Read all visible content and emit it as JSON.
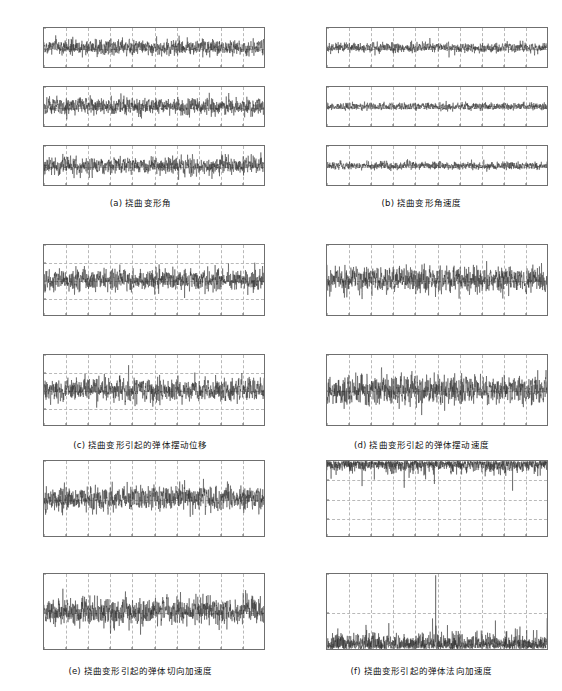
{
  "figure": {
    "background": "#ffffff",
    "trace_color": "#2b2b2b",
    "grid_color": "#b9b9b9",
    "axis_color": "#6f6f6f",
    "xlabel": "t / s",
    "xticks": [
      "0",
      "10",
      "20",
      "30",
      "40",
      "50",
      "60",
      "70",
      "80",
      "90",
      "100"
    ],
    "xlim": [
      0,
      100
    ]
  },
  "panels": [
    {
      "id": "a",
      "caption": "(a) 挠曲变形角",
      "subplots": [
        {
          "ylabel_html": "&Delta;<sub>ϕy</sub> / (°)",
          "ylabel_text": "Δϕy / (°)",
          "yticks": [
            "1",
            "0",
            "-1"
          ],
          "ylim": [
            -1,
            1
          ],
          "gridlines_y": [
            -1,
            0,
            1
          ],
          "noise_sigma": 0.27,
          "seed": 11
        },
        {
          "ylabel_html": "&Delta;<sub>ϕy</sub> / (°)",
          "ylabel_text": "Δϕy / (°)",
          "yticks": [
            "1",
            "0",
            "-1"
          ],
          "ylim": [
            -1,
            1
          ],
          "gridlines_y": [
            -1,
            0,
            1
          ],
          "noise_sigma": 0.3,
          "seed": 23
        },
        {
          "ylabel_html": "&Delta;<sub>ϕz</sub> / (°)",
          "ylabel_text": "Δϕz / (°)",
          "yticks": [
            "1",
            "0",
            "-1"
          ],
          "ylim": [
            -1,
            1
          ],
          "gridlines_y": [
            -1,
            0,
            1
          ],
          "noise_sigma": 0.3,
          "seed": 37
        }
      ]
    },
    {
      "id": "b",
      "caption": "(b) 挠曲变形角速度",
      "subplots": [
        {
          "ylabel_html": "&omega;<sub>ϕx</sub> / (°) ·/s",
          "ylabel_text": "ωϕx / (°)/s",
          "yticks": [
            "20",
            "0",
            "-20"
          ],
          "ylim": [
            -20,
            20
          ],
          "gridlines_y": [
            -20,
            0,
            20
          ],
          "noise_sigma": 3.4,
          "seed": 51
        },
        {
          "ylabel_html": "&omega;<sub>ϕy</sub> / (°) ·/s",
          "ylabel_text": "ωϕy / (°)/s",
          "yticks": [
            "50",
            "0",
            "-50"
          ],
          "ylim": [
            -50,
            50
          ],
          "gridlines_y": [
            -50,
            0,
            50
          ],
          "noise_sigma": 6.5,
          "seed": 67
        },
        {
          "ylabel_html": "&omega;<sub>ϕz</sub> / (°) ·/s",
          "ylabel_text": "ωϕz / (°)/s",
          "yticks": [
            "50",
            "0",
            "-50"
          ],
          "ylim": [
            -50,
            50
          ],
          "gridlines_y": [
            -50,
            0,
            50
          ],
          "noise_sigma": 6.8,
          "seed": 83
        }
      ]
    },
    {
      "id": "c",
      "caption": "(c) 挠曲变形引起的弹体摆动位移",
      "subplots": [
        {
          "ylabel_html": "<span class=\"it\">P</span><sub>fy</sub> / m",
          "ylabel_text": "Pfy / m",
          "yticks": [
            "0.02",
            "0.01",
            "0",
            "-0.01",
            "-0.02"
          ],
          "ylim": [
            -0.02,
            0.02
          ],
          "gridlines_y": [
            -0.02,
            -0.01,
            0,
            0.01,
            0.02
          ],
          "noise_sigma": 0.0042,
          "seed": 101
        },
        {
          "ylabel_html": "<span class=\"it\">P</span><sub>fz</sub> / m",
          "ylabel_text": "Pfz / m",
          "yticks": [
            "0.02",
            "0.01",
            "0",
            "-0.01",
            "-0.02"
          ],
          "ylim": [
            -0.02,
            0.02
          ],
          "gridlines_y": [
            -0.02,
            -0.01,
            0,
            0.01,
            0.02
          ],
          "noise_sigma": 0.0045,
          "seed": 113
        }
      ]
    },
    {
      "id": "d",
      "caption": "(d) 挠曲变形引起的弹体摆动速度",
      "subplots": [
        {
          "ylabel_html": "<span class=\"it\">V</span><sub>fy</sub> / m/s",
          "ylabel_text": "Vfy / m/s",
          "yticks": [
            "0.5",
            "0",
            "-0.5"
          ],
          "ylim": [
            -0.5,
            0.5
          ],
          "gridlines_y": [
            -0.5,
            0,
            0.5
          ],
          "noise_sigma": 0.13,
          "seed": 131
        },
        {
          "ylabel_html": "<span class=\"it\">V</span><sub>fz</sub> / m/s",
          "ylabel_text": "Vfz / m/s",
          "yticks": [
            "0.5",
            "0",
            "-0.5"
          ],
          "ylim": [
            -0.5,
            0.5
          ],
          "gridlines_y": [
            -0.5,
            0,
            0.5
          ],
          "noise_sigma": 0.14,
          "seed": 149
        }
      ]
    },
    {
      "id": "e",
      "caption": "(e) 挠曲变形引起的弹体切向加速度",
      "subplots": [
        {
          "ylabel_html": "<span class=\"it\">a</span><sub>fy</sub> / m·s<sup>-2</sup>",
          "ylabel_text": "afy / m·s-2",
          "yticks": [
            "5",
            "0",
            "-5"
          ],
          "ylim": [
            -5,
            5
          ],
          "gridlines_y": [
            -5,
            0,
            5
          ],
          "noise_sigma": 1.1,
          "seed": 167
        },
        {
          "ylabel_html": "<span class=\"it\">a</span><sub>fz</sub> / m·s<sup>-2</sup>",
          "ylabel_text": "afz / m·s-2",
          "yticks": [
            "5",
            "0",
            "-5"
          ],
          "ylim": [
            -5,
            5
          ],
          "gridlines_y": [
            -5,
            0,
            5
          ],
          "noise_sigma": 1.3,
          "seed": 181
        }
      ]
    },
    {
      "id": "f",
      "caption": "(f) 挠曲变形引起的弹体法向加速度",
      "subplots": [
        {
          "ylabel_html": "<span class=\"it\">a</span><sub>fny</sub> / m·s<sup>-2</sup>",
          "ylabel_text": "afny / m·s-2",
          "yticks": [
            "0",
            "-0.1",
            "-0.2",
            "-0.3",
            "-0.4"
          ],
          "ylim": [
            -0.4,
            0
          ],
          "gridlines_y": [
            -0.4,
            -0.3,
            -0.2,
            -0.1,
            0
          ],
          "noise_sigma": 0.03,
          "rectified": "negative",
          "seed": 199
        },
        {
          "ylabel_html": "<span class=\"it\">a</span><sub>fnz</sub> / m·s<sup>-2</sup>",
          "ylabel_text": "afnz / m·s-2",
          "yticks": [
            "0.1",
            "0.05",
            "0"
          ],
          "ylim": [
            0,
            0.1
          ],
          "gridlines_y": [
            0,
            0.05,
            0.1
          ],
          "noise_sigma": 0.011,
          "rectified": "positive",
          "seed": 211
        }
      ]
    }
  ],
  "chart_data": {
    "type": "line",
    "xlabel": "t / s",
    "x_range": [
      0,
      100
    ],
    "x_tick_step": 10,
    "grid": true,
    "legend": "none",
    "subplot_count": 13,
    "series": [
      {
        "panel": "a",
        "name": "Δϕy / (°)",
        "ylim": [
          -1,
          1
        ],
        "yticks": [
          -1,
          0,
          1
        ],
        "rms": 0.27
      },
      {
        "panel": "a",
        "name": "Δϕy / (°)",
        "ylim": [
          -1,
          1
        ],
        "yticks": [
          -1,
          0,
          1
        ],
        "rms": 0.3
      },
      {
        "panel": "a",
        "name": "Δϕz / (°)",
        "ylim": [
          -1,
          1
        ],
        "yticks": [
          -1,
          0,
          1
        ],
        "rms": 0.3
      },
      {
        "panel": "b",
        "name": "ωϕx / (°)/s",
        "ylim": [
          -20,
          20
        ],
        "yticks": [
          -20,
          0,
          20
        ],
        "rms": 3.4
      },
      {
        "panel": "b",
        "name": "ωϕy / (°)/s",
        "ylim": [
          -50,
          50
        ],
        "yticks": [
          -50,
          0,
          50
        ],
        "rms": 6.5
      },
      {
        "panel": "b",
        "name": "ωϕz / (°)/s",
        "ylim": [
          -50,
          50
        ],
        "yticks": [
          -50,
          0,
          50
        ],
        "rms": 6.8
      },
      {
        "panel": "c",
        "name": "Pfy / m",
        "ylim": [
          -0.02,
          0.02
        ],
        "yticks": [
          -0.02,
          -0.01,
          0,
          0.01,
          0.02
        ],
        "rms": 0.0042
      },
      {
        "panel": "c",
        "name": "Pfz / m",
        "ylim": [
          -0.02,
          0.02
        ],
        "yticks": [
          -0.02,
          -0.01,
          0,
          0.01,
          0.02
        ],
        "rms": 0.0045
      },
      {
        "panel": "d",
        "name": "Vfy / m/s",
        "ylim": [
          -0.5,
          0.5
        ],
        "yticks": [
          -0.5,
          0,
          0.5
        ],
        "rms": 0.13
      },
      {
        "panel": "d",
        "name": "Vfz / m/s",
        "ylim": [
          -0.5,
          0.5
        ],
        "yticks": [
          -0.5,
          0,
          0.5
        ],
        "rms": 0.14
      },
      {
        "panel": "e",
        "name": "afy / m·s-2",
        "ylim": [
          -5,
          5
        ],
        "yticks": [
          -5,
          0,
          5
        ],
        "rms": 1.1
      },
      {
        "panel": "e",
        "name": "afz / m·s-2",
        "ylim": [
          -5,
          5
        ],
        "yticks": [
          -5,
          0,
          5
        ],
        "rms": 1.3
      },
      {
        "panel": "f",
        "name": "afny / m·s-2",
        "ylim": [
          -0.4,
          0
        ],
        "yticks": [
          -0.4,
          -0.3,
          -0.2,
          -0.1,
          0
        ],
        "rms": 0.03
      },
      {
        "panel": "f",
        "name": "afnz / m·s-2",
        "ylim": [
          0,
          0.1
        ],
        "yticks": [
          0,
          0.05,
          0.1
        ],
        "rms": 0.011
      }
    ]
  }
}
